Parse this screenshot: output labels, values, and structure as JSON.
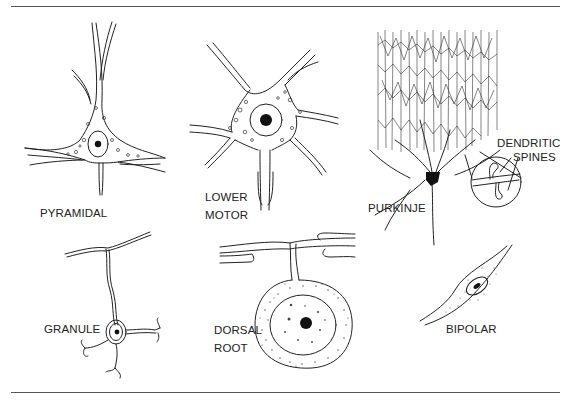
{
  "figure": {
    "panels": [
      {
        "id": "pyramidal",
        "label": "PYRAMIDAL"
      },
      {
        "id": "lower-motor",
        "label_line1": "LOWER",
        "label_line2": "MOTOR"
      },
      {
        "id": "purkinje",
        "label": "PURKINJE",
        "callout_line1": "DENDRITIC",
        "callout_line2": "SPINES"
      },
      {
        "id": "granule",
        "label": "GRANULE"
      },
      {
        "id": "dorsal-root",
        "label_line1": "DORSAL",
        "label_line2": "ROOT"
      },
      {
        "id": "bipolar",
        "label": "BIPOLAR"
      }
    ],
    "colors": {
      "ink": "#222222",
      "rule": "#555555",
      "background": "#ffffff"
    }
  }
}
